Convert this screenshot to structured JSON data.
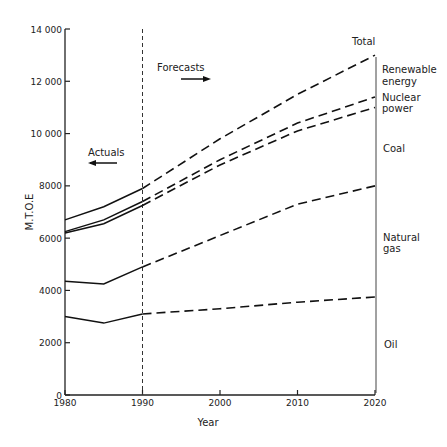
{
  "chart_data": {
    "type": "line",
    "title": "",
    "xlabel": "Year",
    "ylabel": "M.T.O.E",
    "xlim": [
      1980,
      2020
    ],
    "ylim": [
      0,
      14000
    ],
    "x_ticks": [
      "1980",
      "1990",
      "2000",
      "2010",
      "2020"
    ],
    "y_ticks": [
      "0",
      "2000",
      "4000",
      "6000",
      "8000",
      "10 000",
      "12 000",
      "14 000"
    ],
    "grid": false,
    "x": [
      1980,
      1985,
      1990,
      2000,
      2010,
      2020
    ],
    "divider_year": 1990,
    "annotations": {
      "actuals": "Actuals",
      "forecasts": "Forecasts"
    },
    "series": [
      {
        "name": "Total",
        "values": [
          6700,
          7200,
          7900,
          9800,
          11500,
          13000
        ]
      },
      {
        "name": "Nuclear power (upper bound)",
        "values": [
          6250,
          6700,
          7400,
          9000,
          10400,
          11400
        ]
      },
      {
        "name": "Coal (upper bound)",
        "values": [
          6200,
          6550,
          7250,
          8800,
          10100,
          11000
        ]
      },
      {
        "name": "Natural gas (upper bound)",
        "values": [
          4350,
          4250,
          4900,
          6100,
          7300,
          8000
        ]
      },
      {
        "name": "Oil (upper bound)",
        "values": [
          3000,
          2750,
          3100,
          3300,
          3550,
          3750
        ]
      }
    ],
    "band_labels": [
      {
        "label": "Total",
        "lines": [
          "Total"
        ]
      },
      {
        "label": "Renewable energy",
        "lines": [
          "Renewable",
          "energy"
        ]
      },
      {
        "label": "Nuclear power",
        "lines": [
          "Nuclear",
          "power"
        ]
      },
      {
        "label": "Coal",
        "lines": [
          "Coal"
        ]
      },
      {
        "label": "Natural gas",
        "lines": [
          "Natural",
          "gas"
        ]
      },
      {
        "label": "Oil",
        "lines": [
          "Oil"
        ]
      }
    ]
  },
  "labels": {
    "actuals": "Actuals",
    "forecasts": "Forecasts",
    "xlabel": "Year",
    "ylabel": "M.T.O.E",
    "total": "Total",
    "renewable_1": "Renewable",
    "renewable_2": "energy",
    "nuclear_1": "Nuclear",
    "nuclear_2": "power",
    "coal": "Coal",
    "gas_1": "Natural",
    "gas_2": "gas",
    "oil": "Oil"
  }
}
